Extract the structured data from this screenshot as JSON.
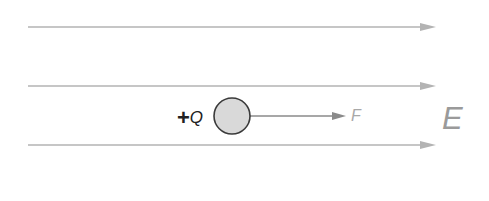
{
  "diagram": {
    "field_label": "E",
    "charge_label_sign": "+",
    "charge_label_symbol": "Q",
    "force_label": "F",
    "field_lines": [
      {
        "y": 27,
        "x_start": 28,
        "x_end": 436
      },
      {
        "y": 86,
        "x_start": 28,
        "x_end": 436
      },
      {
        "y": 145,
        "x_start": 28,
        "x_end": 436
      }
    ],
    "charge": {
      "cx": 232,
      "cy": 116,
      "r": 18,
      "fill": "#d9d9d9",
      "stroke": "#3a3a3a"
    },
    "force_arrow": {
      "x_start": 250,
      "x_end": 346,
      "y": 116
    },
    "colors": {
      "field_line": "#b3b3b3",
      "force_arrow": "#8a8a8a",
      "field_label": "#9a9a9a",
      "charge_label": "#222222"
    }
  }
}
